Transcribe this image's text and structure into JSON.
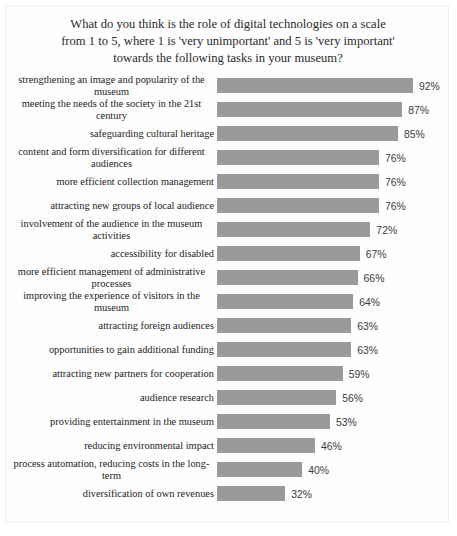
{
  "chart_data": {
    "type": "bar",
    "orientation": "horizontal",
    "title": "What do you think is the role of digital technologies on a scale\nfrom 1 to 5, where 1 is 'very unimportant' and 5 is 'very important'\ntowards the following tasks in your museum?",
    "xlabel": "",
    "ylabel": "",
    "xlim": [
      0,
      100
    ],
    "grid": false,
    "legend": false,
    "value_suffix": "%",
    "bar_color": "#999a99",
    "categories": [
      "strengthening an image and popularity of the museum",
      "meeting the needs of the society in the 21st century",
      "safeguarding cultural heritage",
      "content and form diversification for different audiences",
      "more efficient collection management",
      "attracting new groups of local audience",
      "involvement of the audience in the museum activities",
      "accessibility for disabled",
      "more efficient management of administrative processes",
      "improving the experience of visitors in the museum",
      "attracting foreign audiences",
      "opportunities to gain additional funding",
      "attracting new partners for cooperation",
      "audience research",
      "providing entertainment in the museum",
      "reducing environmental impact",
      "process automation, reducing costs in the long-term",
      "diversification of own revenues"
    ],
    "values": [
      92,
      87,
      85,
      76,
      76,
      76,
      72,
      67,
      66,
      64,
      63,
      63,
      59,
      56,
      53,
      46,
      40,
      32
    ],
    "value_labels": [
      "92%",
      "87%",
      "85%",
      "76%",
      "76%",
      "76%",
      "72%",
      "67%",
      "66%",
      "64%",
      "63%",
      "63%",
      "59%",
      "56%",
      "53%",
      "46%",
      "40%",
      "32%"
    ]
  }
}
